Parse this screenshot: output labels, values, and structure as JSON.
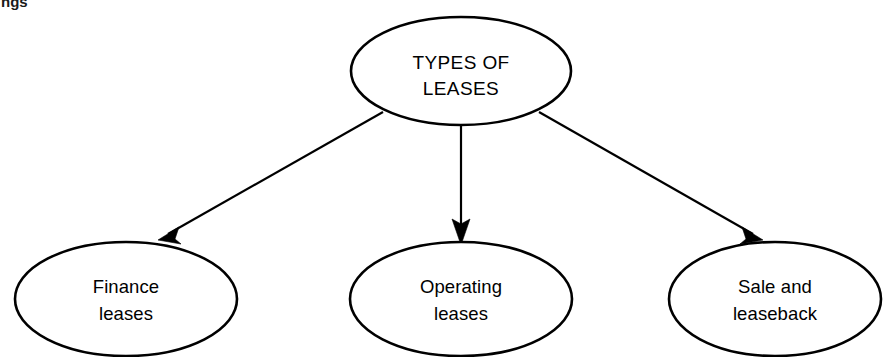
{
  "page": {
    "width": 885,
    "height": 357,
    "background_color": "#ffffff",
    "ink_color": "#000000",
    "clipped_heading_fragment": "ngs"
  },
  "diagram": {
    "type": "hierarchy-tree",
    "orientation": "top-down",
    "root": {
      "id": "types-of-leases",
      "label_line_1": "TYPES OF",
      "label_line_2": "LEASES",
      "shape": "ellipse",
      "cx": 461,
      "cy": 71,
      "rx": 110,
      "ry": 54
    },
    "children": [
      {
        "id": "finance-leases",
        "label_line_1": "Finance",
        "label_line_2": "leases",
        "shape": "ellipse",
        "cx": 126,
        "cy": 299,
        "rx": 111,
        "ry": 57
      },
      {
        "id": "operating-leases",
        "label_line_1": "Operating",
        "label_line_2": "leases",
        "shape": "ellipse",
        "cx": 461,
        "cy": 299,
        "rx": 111,
        "ry": 57
      },
      {
        "id": "sale-and-leaseback",
        "label_line_1": "Sale and",
        "label_line_2": "leaseback",
        "shape": "ellipse",
        "cx": 775,
        "cy": 299,
        "rx": 106,
        "ry": 57
      }
    ],
    "connectors": [
      {
        "id": "arrow-root-to-finance",
        "from": "types-of-leases",
        "to": "finance-leases",
        "x1": 383,
        "y1": 112,
        "x2": 160,
        "y2": 238,
        "arrowhead": "filled-triangle"
      },
      {
        "id": "arrow-root-to-operating",
        "from": "types-of-leases",
        "to": "operating-leases",
        "x1": 461,
        "y1": 126,
        "x2": 461,
        "y2": 243,
        "arrowhead": "filled-triangle"
      },
      {
        "id": "arrow-root-to-saleleaseback",
        "from": "types-of-leases",
        "to": "sale-and-leaseback",
        "x1": 539,
        "y1": 112,
        "x2": 761,
        "y2": 243,
        "arrowhead": "filled-triangle"
      }
    ]
  }
}
